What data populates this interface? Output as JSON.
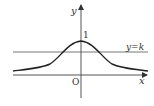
{
  "diagram": {
    "type": "function-graph",
    "axes": {
      "x_label": "x",
      "y_label": "y",
      "origin_label": "O"
    },
    "curve": {
      "description": "bell-shaped curve symmetric about the y-axis, maximum at y-intercept",
      "peak_label": "1"
    },
    "line": {
      "label": "y=k",
      "description": "horizontal line with 0 < k < 1 intersecting the curve at two points"
    },
    "colors": {
      "axis": "#555555",
      "curve": "#222222",
      "line": "#777777",
      "background": "#ffffff"
    }
  }
}
